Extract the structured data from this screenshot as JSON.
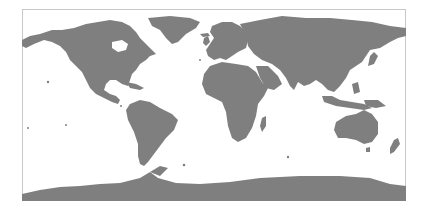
{
  "map": {
    "projection": "equirectangular",
    "land_color": "#7f7f7f",
    "water_color": "#ffffff",
    "frame_color": "#c8c8c8",
    "frame": {
      "x": 22,
      "y": 9,
      "width": 384,
      "height": 192
    },
    "regions": [
      {
        "name": "North America"
      },
      {
        "name": "Greenland"
      },
      {
        "name": "South America"
      },
      {
        "name": "Europe"
      },
      {
        "name": "Africa"
      },
      {
        "name": "Asia"
      },
      {
        "name": "Australia"
      },
      {
        "name": "Antarctica"
      }
    ]
  }
}
